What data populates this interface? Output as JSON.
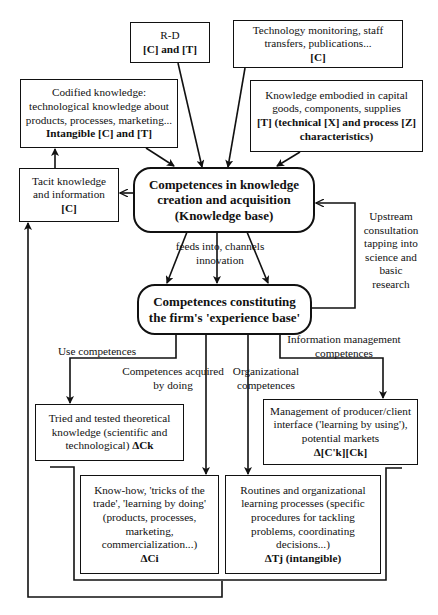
{
  "diagram": {
    "nodes": {
      "rd": {
        "line1": "R-D",
        "line2": "[C] and [T]"
      },
      "tech_monitoring": {
        "line1": "Technology monitoring, staff",
        "line2": "transfers, publications...",
        "line3": "[C]"
      },
      "codified": {
        "line1": "Codified knowledge:",
        "line2": "technological knowledge about",
        "line3": "products, processes, marketing...",
        "line4": "Intangible [C] and [T]"
      },
      "embodied": {
        "line1": "Knowledge embodied in capital",
        "line2": "goods, components, supplies",
        "line3": "[T] (technical [X] and process [Z]",
        "line4": "characteristics)"
      },
      "tacit": {
        "line1": "Tacit knowledge",
        "line2": "and information",
        "line3": "[C]"
      },
      "knowledge_base": {
        "line1": "Competences in knowledge",
        "line2": "creation and acquisition",
        "line3": "(Knowledge base)"
      },
      "experience_base": {
        "line1": "Competences constituting",
        "line2": "the firm's 'experience base'"
      },
      "tried_tested": {
        "line1": "Tried and tested theoretical",
        "line2": "knowledge (scientific and",
        "line3": "technological) ΔCk"
      },
      "management": {
        "line1": "Management of producer/client",
        "line2": "interface ('learning by using'),",
        "line3": "potential markets",
        "line4": "Δ[C'k][Ck]"
      },
      "know_how": {
        "line1": "Know-how, 'tricks of the",
        "line2": "trade', 'learning by doing'",
        "line3": "(products, processes,",
        "line4": "marketing,",
        "line5": "commercialization...)",
        "line6": "ΔCi"
      },
      "routines": {
        "line1": "Routines and organizational",
        "line2": "learning processes (specific",
        "line3": "procedures for tackling",
        "line4": "problems, coordinating",
        "line5": "decisions...)",
        "line6": "ΔTj (intangible)"
      }
    },
    "edge_labels": {
      "feeds": {
        "line1": "feeds into, channels",
        "line2": "innovation"
      },
      "upstream": {
        "line1": "Upstream",
        "line2": "consultation",
        "line3": "tapping into",
        "line4": "science and",
        "line5": "basic",
        "line6": "research"
      },
      "use": {
        "line1": "Use competences"
      },
      "acquired": {
        "line1": "Competences acquired",
        "line2": "by doing"
      },
      "organizational": {
        "line1": "Organizational",
        "line2": "competences"
      },
      "info_mgmt": {
        "line1": "Information management",
        "line2": "competences"
      }
    },
    "colors": {
      "stroke": "#111111",
      "background": "#ffffff"
    }
  }
}
